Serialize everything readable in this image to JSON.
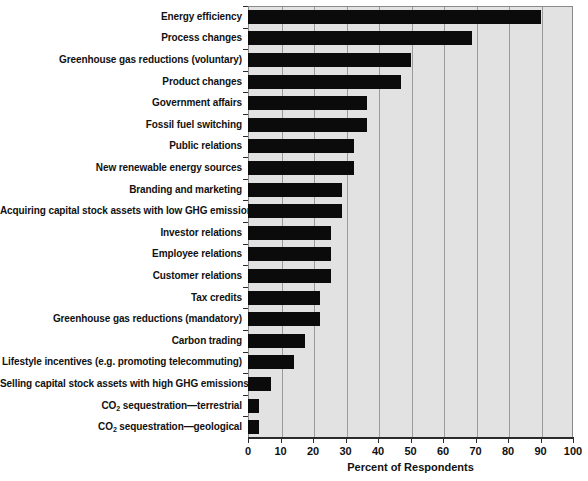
{
  "chart_data": {
    "type": "bar",
    "orientation": "horizontal",
    "title": "",
    "xlabel": "Percent of Respondents",
    "ylabel": "",
    "xlim": [
      0,
      100
    ],
    "xticks": [
      0,
      10,
      20,
      30,
      40,
      50,
      60,
      70,
      80,
      90,
      100
    ],
    "grid": true,
    "legend": null,
    "bar_color": "#0b0b0b",
    "plot_background": "#e2e2e2",
    "categories": [
      "Energy efficiency",
      "Process changes",
      "Greenhouse gas reductions (voluntary)",
      "Product changes",
      "Government affairs",
      "Fossil fuel switching",
      "Public relations",
      "New renewable energy sources",
      "Branding and marketing",
      "Acquiring capital stock assets with low GHG emissions",
      "Investor relations",
      "Employee relations",
      "Customer relations",
      "Tax credits",
      "Greenhouse gas reductions (mandatory)",
      "Carbon trading",
      "Lifestyle incentives (e.g. promoting telecommuting)",
      "Selling capital stock assets with high GHG emissions",
      "CO2 sequestration—terrestrial",
      "CO2 sequestration—geological"
    ],
    "categories_html": [
      "Energy efficiency",
      "Process changes",
      "Greenhouse gas reductions (voluntary)",
      "Product changes",
      "Government affairs",
      "Fossil fuel switching",
      "Public relations",
      "New renewable energy sources",
      "Branding and marketing",
      "Acquiring capital stock assets with low GHG emissions",
      "Investor relations",
      "Employee relations",
      "Customer relations",
      "Tax credits",
      "Greenhouse gas reductions (mandatory)",
      "Carbon trading",
      "Lifestyle incentives (e.g. promoting telecommuting)",
      "Selling capital stock assets with high GHG emissions",
      "CO<sub>2</sub> sequestration—terrestrial",
      "CO<sub>2</sub> sequestration—geological"
    ],
    "values": [
      90,
      69,
      50,
      47,
      36.5,
      36.5,
      32.5,
      32.5,
      29,
      29,
      25.5,
      25.5,
      25.5,
      22,
      22,
      17.5,
      14,
      7,
      3.5,
      3.5
    ]
  }
}
